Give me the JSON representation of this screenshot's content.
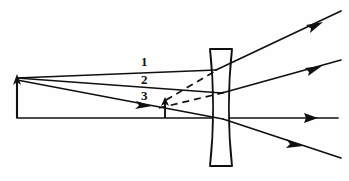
{
  "figure": {
    "type": "optics-ray-diagram",
    "width": 349,
    "height": 181,
    "background_color": "#fefefe",
    "ink_color": "#101010"
  },
  "labels": {
    "ray_one": "1",
    "ray_two": "2",
    "ray_three": "3"
  },
  "label_positions": {
    "ray_one": {
      "x": 141,
      "y": 55
    },
    "ray_two": {
      "x": 141,
      "y": 73
    },
    "ray_three": {
      "x": 141,
      "y": 89
    }
  },
  "optical_axis": {
    "name": "optical-axis",
    "y": 118,
    "x_start": 17,
    "x_end": 338,
    "arrow_at_x": 312
  },
  "lens": {
    "name": "diverging-lens",
    "kind": "biconcave",
    "center_x": 221,
    "top_y": 48,
    "bottom_y": 167,
    "top_half_width": 11,
    "waist_half_width": 4.5,
    "rim_flat_half_width": 11
  },
  "object_arrow": {
    "name": "object-arrow",
    "x": 17,
    "base_y": 118,
    "tip_y": 78,
    "direction": "up"
  },
  "image_arrow": {
    "name": "image-arrow",
    "x": 165,
    "base_y": 118,
    "tip_y": 100,
    "direction": "up"
  },
  "rays": [
    {
      "name": "ray-1-parallel",
      "label": "1",
      "style": "solid",
      "incident": {
        "x1": 17,
        "y1": 78,
        "x2": 215,
        "y2": 70
      },
      "refracted": {
        "x1": 215,
        "y1": 70,
        "x2": 338,
        "y2": 13
      },
      "arrowheads": [
        {
          "x": 312,
          "y": 25,
          "angle_deg": -25
        }
      ]
    },
    {
      "name": "ray-2-through-center",
      "label": "2",
      "style": "solid",
      "incident": {
        "x1": 17,
        "y1": 78,
        "x2": 221,
        "y2": 93
      },
      "refracted": {
        "x1": 221,
        "y1": 93,
        "x2": 338,
        "y2": 62
      },
      "arrowheads": [
        {
          "x": 310,
          "y": 69,
          "angle_deg": -15
        }
      ]
    },
    {
      "name": "ray-3-to-focus",
      "label": "3",
      "style": "solid",
      "incident": {
        "x1": 17,
        "y1": 80,
        "x2": 221,
        "y2": 119
      },
      "refracted": {
        "x1": 221,
        "y1": 119,
        "x2": 338,
        "y2": 157
      },
      "arrowheads": [
        {
          "x": 142,
          "y": 104,
          "angle_deg": 11
        },
        {
          "x": 292,
          "y": 142,
          "angle_deg": 18
        }
      ]
    }
  ],
  "virtual_extensions": [
    {
      "name": "dashed-extension-ray-1",
      "style": "dashed",
      "x1": 165,
      "y1": 100,
      "x2": 216,
      "y2": 70
    },
    {
      "name": "dashed-extension-ray-2",
      "style": "dashed",
      "x1": 160,
      "y1": 107,
      "x2": 224,
      "y2": 92
    }
  ]
}
